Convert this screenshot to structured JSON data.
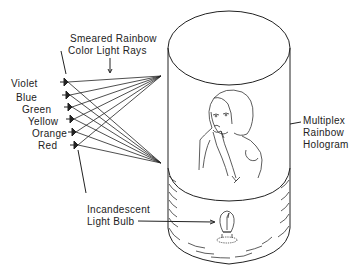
{
  "diagram": {
    "type": "multiplex rainbow hologram viewing geometry",
    "labels": {
      "rays": [
        "Smeared Rainbow",
        "Color Light Rays"
      ],
      "colors": [
        "Violet",
        "Blue",
        "Green",
        "Yellow",
        "Orange",
        "Red"
      ],
      "hologram": [
        "Multiplex",
        "Rainbow",
        "Hologram"
      ],
      "bulb": [
        "Incandescent",
        "Light Bulb"
      ]
    },
    "components": {
      "cylinder": "transparent cylindrical hologram drum",
      "figure": "woman with hand at chin (holographic image)",
      "source": "incandescent light bulb at base",
      "viewer_eyes": "six eye positions, one per color"
    },
    "colors": {
      "line": "#222222",
      "background": "#ffffff"
    }
  }
}
